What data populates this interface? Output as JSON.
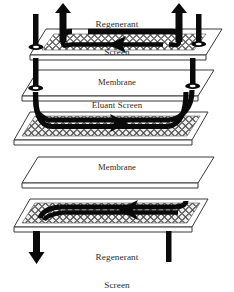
{
  "diagram": {
    "labels": {
      "regenerant_top_line1": "Regenerant",
      "regenerant_top_line2": "Screen",
      "membrane_upper": "Membrane",
      "eluant_screen": "Eluant Screen",
      "membrane_lower": "Membrane",
      "regenerant_bottom_line1": "Regenerant",
      "regenerant_bottom_line2": "Screen"
    },
    "layers": [
      {
        "name": "regenerant-screen-top",
        "type": "screen",
        "label": "Regenerant Screen",
        "flow_direction": "right-to-left"
      },
      {
        "name": "membrane-upper",
        "type": "membrane",
        "label": "Membrane",
        "flow_direction": "none"
      },
      {
        "name": "eluant-screen",
        "type": "screen",
        "label": "Eluant Screen",
        "flow_direction": "left-to-right"
      },
      {
        "name": "membrane-lower",
        "type": "membrane",
        "label": "Membrane",
        "flow_direction": "none"
      },
      {
        "name": "regenerant-screen-bottom",
        "type": "screen",
        "label": "Regenerant Screen",
        "flow_direction": "right-to-left"
      }
    ],
    "ports": [
      {
        "name": "regenerant-outlet-top-left",
        "side": "left",
        "position": "top",
        "arrow": "up"
      },
      {
        "name": "regenerant-outlet-top-right",
        "side": "right",
        "position": "top",
        "arrow": "up"
      },
      {
        "name": "eluant-inlet-pipe-left",
        "side": "left",
        "position": "middle",
        "arrow": "none"
      },
      {
        "name": "eluant-outlet-pipe-right",
        "side": "right",
        "position": "middle",
        "arrow": "none"
      },
      {
        "name": "regenerant-outlet-bottom-left",
        "side": "left",
        "position": "bottom",
        "arrow": "down"
      },
      {
        "name": "regenerant-inlet-bottom-right",
        "side": "right",
        "position": "bottom",
        "arrow": "none"
      }
    ],
    "colors": {
      "ink": "#000000",
      "plate_fill": "#ffffff",
      "plate_edge": "#2b2b2b",
      "mesh": "#4a4a4a",
      "text": "#2b2b2b"
    }
  }
}
